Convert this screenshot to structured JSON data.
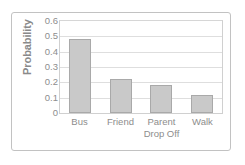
{
  "chart_data": {
    "type": "bar",
    "title": "",
    "xlabel": "",
    "ylabel": "Probability",
    "categories": [
      "Bus",
      "Friend",
      "Parent Drop Off",
      "Walk"
    ],
    "category_lines": [
      [
        "Bus"
      ],
      [
        "Friend"
      ],
      [
        "Parent",
        "Drop Off"
      ],
      [
        "Walk"
      ]
    ],
    "values": [
      0.48,
      0.22,
      0.185,
      0.12
    ],
    "ylim": [
      0,
      0.6
    ],
    "ytick_labels": [
      "0.6",
      "0.5",
      "0.4",
      "0.3",
      "0.2",
      "0.1",
      "0"
    ],
    "ytick_values": [
      0.6,
      0.5,
      0.4,
      0.3,
      0.2,
      0.1,
      0
    ],
    "grid": true,
    "legend": false,
    "colors": {
      "bar_fill": "#c9c9c9",
      "bar_border": "#a9a9a9",
      "gridline": "#dedede",
      "axis_border": "#d0d0d0",
      "text": "#8d8d8d",
      "axis_title": "#8a8a8a",
      "frame": "#c2c2c2",
      "background": "#ffffff"
    }
  }
}
